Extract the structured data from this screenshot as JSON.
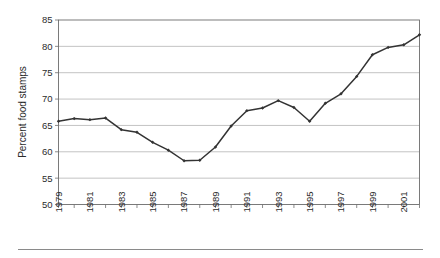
{
  "chart_data": {
    "type": "line",
    "title": "",
    "subtitle": "",
    "xlabel": "",
    "ylabel": "Percent food stamps",
    "ylim": [
      50,
      85
    ],
    "xlim": [
      1979,
      2002
    ],
    "y_ticks": [
      50,
      55,
      60,
      65,
      70,
      75,
      80,
      85
    ],
    "y_tick_labels": [
      "50",
      "55",
      "60",
      "65",
      "70",
      "75",
      "80",
      "85"
    ],
    "x_tick_labels": [
      "1979",
      "1981",
      "1983",
      "1985",
      "1987",
      "1989",
      "1991",
      "1993",
      "1995",
      "1997",
      "1999",
      "2001"
    ],
    "x_tick_values": [
      1979,
      1981,
      1983,
      1985,
      1987,
      1989,
      1991,
      1993,
      1995,
      1997,
      1999,
      2001
    ],
    "grid": "horizontal",
    "legend": "none",
    "x": [
      1979,
      1980,
      1981,
      1982,
      1983,
      1984,
      1985,
      1986,
      1987,
      1988,
      1989,
      1990,
      1991,
      1992,
      1993,
      1994,
      1995,
      1996,
      1997,
      1998,
      1999,
      2000,
      2001,
      2002
    ],
    "values": [
      65.8,
      66.3,
      66.1,
      66.4,
      64.2,
      63.7,
      61.8,
      60.3,
      58.3,
      58.4,
      60.9,
      64.9,
      67.8,
      68.3,
      69.7,
      68.4,
      65.8,
      69.2,
      71.0,
      74.3,
      78.4,
      79.8,
      80.3,
      82.2
    ],
    "series": [
      {
        "name": "Percent food stamps",
        "color": "#333333",
        "marker": "diamond",
        "values": [
          65.8,
          66.3,
          66.1,
          66.4,
          64.2,
          63.7,
          61.8,
          60.3,
          58.3,
          58.4,
          60.9,
          64.9,
          67.8,
          68.3,
          69.7,
          68.4,
          65.8,
          69.2,
          71.0,
          74.3,
          78.4,
          79.8,
          80.3,
          82.2
        ]
      }
    ],
    "colors": {
      "line": "#333333",
      "gridline": "#a8a8a8",
      "border": "#6d6d6d",
      "text": "#2b2b2b",
      "background": "#ffffff"
    }
  }
}
